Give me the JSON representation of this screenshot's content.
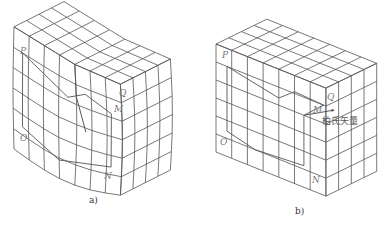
{
  "figure": {
    "panels": [
      {
        "id": "a",
        "caption": "a)",
        "description": "Crystal lattice with screw dislocation and Burgers circuit",
        "labels": {
          "P": "P",
          "Q": "Q",
          "M": "M",
          "N": "N",
          "O": "O"
        }
      },
      {
        "id": "b",
        "caption": "b)",
        "description": "Perfect crystal lattice with the same circuit; closure failure gives Burgers vector",
        "labels": {
          "P": "P",
          "Q": "Q",
          "M": "M",
          "N": "N",
          "O": "O"
        },
        "annotation": "柏氏矢量"
      }
    ],
    "colors": {
      "line": "#555555",
      "label": "#777777",
      "background": "#ffffff"
    }
  }
}
